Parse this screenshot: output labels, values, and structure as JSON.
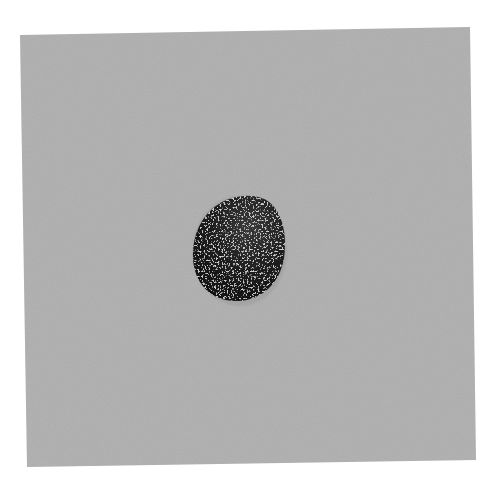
{
  "image": {
    "width": 490,
    "height": 485,
    "background_color": "#ffffff",
    "subject": "dark speckled seed on gray textured paper",
    "surface": {
      "color": "#b2b2b2",
      "corners": [
        [
          20,
          35
        ],
        [
          470,
          27
        ],
        [
          476,
          460
        ],
        [
          27,
          467
        ]
      ]
    },
    "seed": {
      "center": [
        239,
        248
      ],
      "rx": 45,
      "ry": 53,
      "color": "#1c1c1c",
      "highlight_color": "#9a9a9a"
    }
  }
}
